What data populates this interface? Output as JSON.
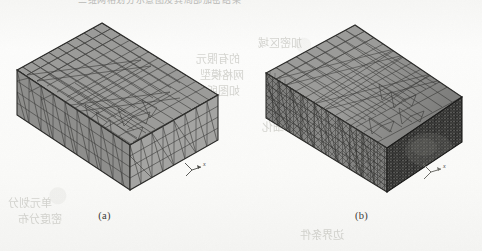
{
  "page": {
    "kind": "scanned-document-figure-page",
    "width": 251,
    "background_color": "#fbfbfa",
    "header_ghost_text": "三维网格划分示意图及其局部加密结果"
  },
  "bleed_through": [
    {
      "text": "的有限元",
      "x": 196,
      "y": 52
    },
    {
      "text": "网格模型",
      "x": 200,
      "y": 68
    },
    {
      "text": "如图所示",
      "x": 196,
      "y": 84
    },
    {
      "text": "单元划分",
      "x": 8,
      "y": 196
    },
    {
      "text": "密度分布",
      "x": 18,
      "y": 212
    },
    {
      "text": "加密区域",
      "x": 258,
      "y": 36
    },
    {
      "text": "局部细化",
      "x": 262,
      "y": 120
    },
    {
      "text": "边界条件",
      "x": 300,
      "y": 228
    }
  ],
  "figures": [
    {
      "id": "figure-a",
      "caption": "(a)",
      "description": "uniform coarse tetrahedral surface mesh on a rectangular box",
      "mesh_type": "uniform",
      "fill_color": "#9b9b99",
      "edge_color": "#3c3c3a",
      "axis_marker": {
        "label": "x",
        "origin_x": 192,
        "origin_y": 170
      },
      "box": {
        "top_apex": [
          102,
          23
        ],
        "left_corner": [
          17,
          70
        ],
        "right_corner": [
          218,
          95
        ],
        "front_corner": [
          130,
          145
        ],
        "bottom_front": [
          130,
          190
        ],
        "bottom_left": [
          17,
          115
        ],
        "bottom_right": [
          218,
          140
        ]
      }
    },
    {
      "id": "figure-b",
      "caption": "(b)",
      "description": "graded mesh, coarse on top-left refined to very dense on right face",
      "mesh_type": "graded-refined",
      "fill_color": "#9b9b99",
      "edge_color": "#3c3c3a",
      "dense_face_color": "#414140",
      "axis_marker": {
        "label": "x",
        "origin_x": 190,
        "origin_y": 172
      },
      "box": {
        "top_apex": [
          114,
          25
        ],
        "left_corner": [
          25,
          73
        ],
        "right_corner": [
          221,
          97
        ],
        "front_corner": [
          146,
          148
        ],
        "bottom_front": [
          146,
          192
        ],
        "bottom_left": [
          25,
          118
        ],
        "bottom_right": [
          221,
          142
        ]
      }
    }
  ]
}
